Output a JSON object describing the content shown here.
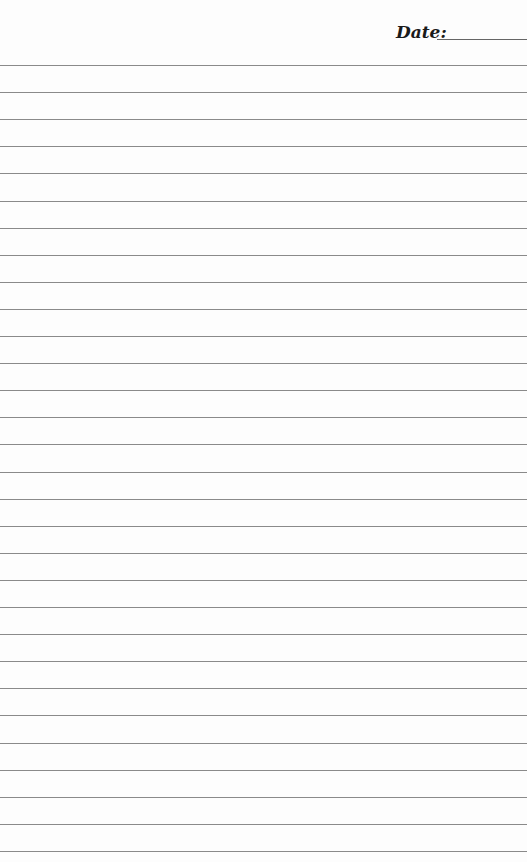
{
  "header": {
    "date_label": "Date:"
  },
  "page": {
    "ruled_line_count": 30,
    "first_line_y": 65,
    "line_spacing": 27.1,
    "line_color": "#8a8a8a",
    "background": "#fdfdfd"
  }
}
